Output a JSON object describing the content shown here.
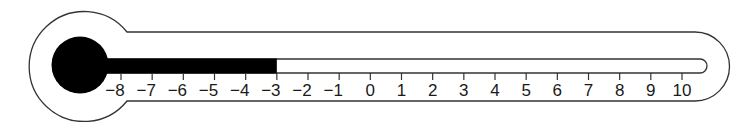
{
  "figure": {
    "type": "thermometer",
    "scale": {
      "min": -8,
      "max": 10,
      "step": 1,
      "labels": [
        "−8",
        "−7",
        "−6",
        "−5",
        "−4",
        "−3",
        "−2",
        "−1",
        "0",
        "1",
        "2",
        "3",
        "4",
        "5",
        "6",
        "7",
        "8",
        "9",
        "10"
      ]
    },
    "reading": -3,
    "colors": {
      "outline": "#333333",
      "mercury": "#000000",
      "background": "#ffffff"
    }
  }
}
